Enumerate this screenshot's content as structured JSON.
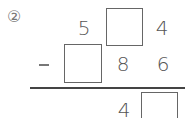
{
  "problem": {
    "label": "②",
    "row1": {
      "hundreds": "5",
      "tens": "",
      "ones": "4"
    },
    "row2": {
      "operator": "−",
      "hundreds": "",
      "tens": "8",
      "ones": "6"
    },
    "result": {
      "hundreds": "",
      "tens": "4",
      "ones": ""
    }
  }
}
